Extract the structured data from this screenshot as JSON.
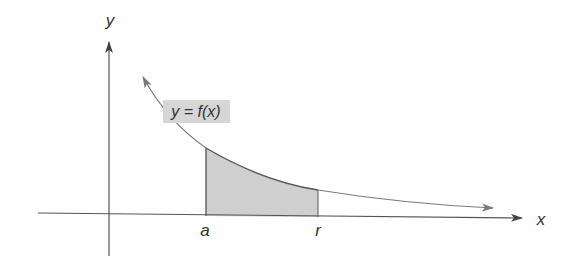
{
  "diagram": {
    "colors": {
      "axis": "#555555",
      "curve": "#7a7a7a",
      "shade": "#cfcfcf",
      "label_box": "#d6d6d6",
      "text": "#333333"
    },
    "axes": {
      "x_label": "x",
      "y_label": "y"
    },
    "curve": {
      "label": "y = f(x)"
    },
    "bounds": {
      "lower_label": "a",
      "upper_label": "r"
    }
  }
}
